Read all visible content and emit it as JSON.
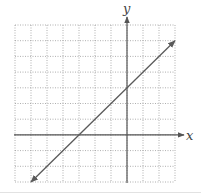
{
  "chart_data": {
    "type": "line",
    "title": "",
    "xlabel": "x",
    "ylabel": "y",
    "xlim": [
      -7,
      3
    ],
    "ylim": [
      -3,
      7
    ],
    "grid": true,
    "grid_style": "dotted",
    "tick_labels": false,
    "series": [
      {
        "name": "line",
        "equation": "y = x + 3",
        "x": [
          -6,
          -3,
          0,
          3
        ],
        "y": [
          -3,
          0,
          3,
          6
        ],
        "arrows_both_ends": true
      }
    ],
    "x_intercept": -3,
    "y_intercept": 3
  },
  "colors": {
    "grid": "#9a9a9a",
    "axis": "#555555",
    "line": "#5a5a5a",
    "label": "#444444"
  }
}
